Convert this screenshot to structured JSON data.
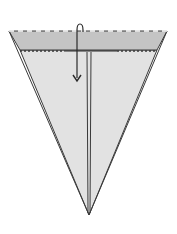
{
  "diagram": {
    "type": "origami-fold-step",
    "colors": {
      "background": "#ffffff",
      "paper_front": "#e2e2e2",
      "flap_band": "#c4c4c4",
      "outline": "#3a3a3a"
    },
    "elements": {
      "top_edge": "dashed valley-fold line",
      "flap_crease": "dotted fold lines",
      "center_line": "vertical double line",
      "fold_arrow": "arrow over top edge pointing down"
    }
  }
}
